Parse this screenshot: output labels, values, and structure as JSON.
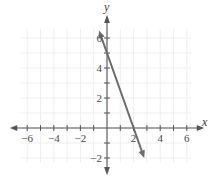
{
  "chart_data": {
    "type": "line",
    "title": "",
    "xlabel": "x",
    "ylabel": "y",
    "xlim": [
      -7,
      7
    ],
    "ylim": [
      -2.8,
      7.3
    ],
    "grid": true,
    "grid_visible_range": {
      "x": [
        -6.5,
        6.3
      ],
      "y": [
        -2.3,
        6.6
      ]
    },
    "x_ticks_major": [
      -6,
      -4,
      -2,
      2,
      4,
      6
    ],
    "x_ticks_minor": [
      -5,
      -3,
      -1,
      1,
      3,
      5
    ],
    "x_tick_labels": [
      "−6",
      "−4",
      "−2",
      "2",
      "4",
      "6"
    ],
    "y_ticks_major": [
      6,
      4,
      2,
      -2
    ],
    "y_ticks_minor": [
      5,
      3,
      1,
      -1
    ],
    "y_tick_labels": [
      "6",
      "4",
      "2",
      "−2"
    ],
    "series": [
      {
        "name": "line",
        "equation": "y = -2.5x + 5",
        "slope": -2.5,
        "y_intercept": 5,
        "x_intercept": 2,
        "color": "#6b6b6b",
        "points": [
          [
            -0.6,
            6.5
          ],
          [
            2.8,
            -2.0
          ]
        ],
        "arrows": "both"
      }
    ],
    "axis_color": "#55555a",
    "grid_color": "#efefef",
    "background": "#ffffff"
  },
  "labels": {
    "x_axis_name": "x",
    "y_axis_name": "y"
  }
}
